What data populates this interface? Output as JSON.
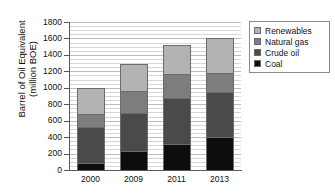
{
  "chart_data": {
    "type": "bar",
    "title": "",
    "subtitle": "",
    "xlabel": "",
    "ylabel": "Barrel of Oil Equivalent (million BOE)",
    "ylabel_line1": "Barrel of Oil Equivalent",
    "ylabel_line2": "(million BOE)",
    "categories": [
      "2000",
      "2009",
      "2011",
      "2013"
    ],
    "ylim": [
      0,
      1800
    ],
    "yticks": [
      0,
      200,
      400,
      600,
      800,
      1000,
      1200,
      1400,
      1600,
      1800
    ],
    "ytick_labels": [
      "0",
      "200",
      "400",
      "600",
      "800",
      "1000",
      "1200",
      "1400",
      "1600",
      "1800"
    ],
    "grid": true,
    "stacked": true,
    "legend_position": "right",
    "series": [
      {
        "name": "Coal",
        "color": "#0d0d0d",
        "values": [
          90,
          230,
          320,
          405
        ]
      },
      {
        "name": "Crude oil",
        "color": "#4a4a4a",
        "values": [
          430,
          460,
          550,
          545
        ]
      },
      {
        "name": "Natural gas",
        "color": "#7d7d7d",
        "values": [
          160,
          265,
          300,
          230
        ]
      },
      {
        "name": "Renewables",
        "color": "#b3b3b3",
        "values": [
          320,
          335,
          345,
          430
        ]
      }
    ],
    "totals": [
      1000,
      1290,
      1515,
      1610
    ],
    "legend_order": [
      "Renewables",
      "Natural gas",
      "Crude oil",
      "Coal"
    ],
    "colors": {
      "renewables": "#b3b3b3",
      "natural_gas": "#7d7d7d",
      "crude_oil": "#4a4a4a",
      "coal": "#0d0d0d",
      "grid": "#d6d6d6",
      "axis": "#5a5a5a",
      "background": "#ffffff"
    }
  },
  "legend": {
    "items": [
      {
        "label": "Renewables"
      },
      {
        "label": "Natural gas"
      },
      {
        "label": "Crude oil"
      },
      {
        "label": "Coal"
      }
    ]
  }
}
